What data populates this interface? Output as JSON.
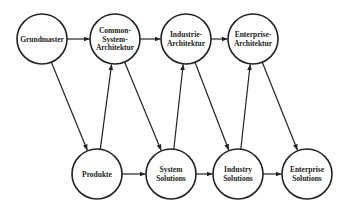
{
  "diagram": {
    "colors": {
      "stroke": "#222222",
      "fill": "#ffffff",
      "text": "#222222",
      "background": "#ffffff"
    },
    "node_radius": 25,
    "nodes": [
      {
        "id": "grundmaster",
        "lines": [
          "Grundmaster"
        ],
        "x": 42,
        "y": 39
      },
      {
        "id": "common-system-architektur",
        "lines": [
          "Common-",
          "System-",
          "Architektur"
        ],
        "x": 115,
        "y": 39
      },
      {
        "id": "industrie-architektur",
        "lines": [
          "Industrie-",
          "Architektur"
        ],
        "x": 186,
        "y": 39
      },
      {
        "id": "enterprise-architektur",
        "lines": [
          "Enterprise-",
          "Architektur"
        ],
        "x": 253,
        "y": 39
      },
      {
        "id": "produkte",
        "lines": [
          "Produkte"
        ],
        "x": 97,
        "y": 174
      },
      {
        "id": "system-solutions",
        "lines": [
          "System",
          "Solutions"
        ],
        "x": 171,
        "y": 174
      },
      {
        "id": "industry-solutions",
        "lines": [
          "Industry",
          "Solutions"
        ],
        "x": 238,
        "y": 174
      },
      {
        "id": "enterprise-solutions",
        "lines": [
          "Enterprise",
          "Solutions"
        ],
        "x": 307,
        "y": 174
      }
    ],
    "edges": [
      {
        "from": "grundmaster",
        "to": "common-system-architektur"
      },
      {
        "from": "common-system-architektur",
        "to": "industrie-architektur"
      },
      {
        "from": "industrie-architektur",
        "to": "enterprise-architektur"
      },
      {
        "from": "produkte",
        "to": "system-solutions"
      },
      {
        "from": "system-solutions",
        "to": "industry-solutions"
      },
      {
        "from": "industry-solutions",
        "to": "enterprise-solutions"
      },
      {
        "from": "grundmaster",
        "to": "produkte"
      },
      {
        "from": "produkte",
        "to": "common-system-architektur"
      },
      {
        "from": "common-system-architektur",
        "to": "system-solutions"
      },
      {
        "from": "system-solutions",
        "to": "industrie-architektur"
      },
      {
        "from": "industrie-architektur",
        "to": "industry-solutions"
      },
      {
        "from": "industry-solutions",
        "to": "enterprise-architektur"
      },
      {
        "from": "enterprise-architektur",
        "to": "enterprise-solutions"
      }
    ]
  }
}
